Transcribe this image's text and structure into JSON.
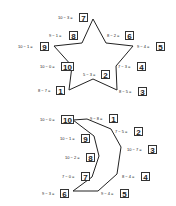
{
  "star": {
    "points": [
      {
        "n": "1",
        "eq": "8 − 7 =",
        "x": 69,
        "y": 90
      },
      {
        "n": "2",
        "eq": "5 − 3 =",
        "x": 93,
        "y": 79
      },
      {
        "n": "3",
        "eq": "8 − 5 =",
        "x": 117,
        "y": 90
      },
      {
        "n": "4",
        "eq": "7 − 3 =",
        "x": 116,
        "y": 66
      },
      {
        "n": "5",
        "eq": "9 − 4 =",
        "x": 133,
        "y": 46
      },
      {
        "n": "6",
        "eq": "8 − 2 =",
        "x": 106,
        "y": 43
      },
      {
        "n": "7",
        "eq": "10 − 3 =",
        "x": 93,
        "y": 19
      },
      {
        "n": "8",
        "eq": "9 − 1 =",
        "x": 82,
        "y": 43
      },
      {
        "n": "9",
        "eq": "10 − 1 =",
        "x": 54,
        "y": 46
      },
      {
        "n": "10",
        "eq": "10 − 0 =",
        "x": 72,
        "y": 66
      }
    ]
  },
  "moon": {
    "points": [
      {
        "n": "1",
        "eq": "9 − 8 =",
        "x": 87,
        "y": 119
      },
      {
        "n": "2",
        "eq": "7 − 5 =",
        "x": 111,
        "y": 129
      },
      {
        "n": "3",
        "eq": "10 − 7 =",
        "x": 121,
        "y": 147
      },
      {
        "n": "4",
        "eq": "8 − 4 =",
        "x": 117,
        "y": 174
      },
      {
        "n": "5",
        "eq": "9 − 4 =",
        "x": 98,
        "y": 191
      },
      {
        "n": "6",
        "eq": "9 − 3 =",
        "x": 73,
        "y": 191
      },
      {
        "n": "7",
        "eq": "7 − 0 =",
        "x": 92,
        "y": 177
      },
      {
        "n": "8",
        "eq": "10 − 2 =",
        "x": 99,
        "y": 156
      },
      {
        "n": "9",
        "eq": "10 − 1 =",
        "x": 94,
        "y": 136
      },
      {
        "n": "10",
        "eq": "10 − 0 =",
        "x": 73,
        "y": 120
      }
    ]
  },
  "labels": {
    "star": [
      {
        "eq": "10 − 3 =",
        "n": "7",
        "ex": 58,
        "ey": 15,
        "bx": 79,
        "by": 13
      },
      {
        "eq": "9 − 1 =",
        "n": "8",
        "ex": 49,
        "ey": 33,
        "bx": 69,
        "by": 31
      },
      {
        "eq": "10 − 1 =",
        "n": "9",
        "ex": 18,
        "ey": 44,
        "bx": 40,
        "by": 42
      },
      {
        "eq": "10 − 0 =",
        "n": "10",
        "ex": 40,
        "ey": 64,
        "bx": 61,
        "by": 62
      },
      {
        "eq": "8 − 7 =",
        "n": "1",
        "ex": 38,
        "ey": 88,
        "bx": 56,
        "by": 86
      },
      {
        "eq": "5 − 3 =",
        "n": "2",
        "ex": 83,
        "ey": 72,
        "bx": 101,
        "by": 70
      },
      {
        "eq": "8 − 2 =",
        "n": "6",
        "ex": 107,
        "ey": 33,
        "bx": 125,
        "by": 31
      },
      {
        "eq": "9 − 4 =",
        "n": "5",
        "ex": 137,
        "ey": 44,
        "bx": 156,
        "by": 42
      },
      {
        "eq": "7 − 3 =",
        "n": "4",
        "ex": 118,
        "ey": 64,
        "bx": 137,
        "by": 62
      },
      {
        "eq": "8 − 5 =",
        "n": "3",
        "ex": 119,
        "ey": 89,
        "bx": 138,
        "by": 87
      }
    ],
    "moon": [
      {
        "eq": "10 − 0 =",
        "n": "10",
        "ex": 40,
        "ey": 117,
        "bx": 61,
        "by": 115
      },
      {
        "eq": "9 − 8 =",
        "n": "1",
        "ex": 90,
        "ey": 116,
        "bx": 109,
        "by": 114
      },
      {
        "eq": "10 − 1 =",
        "n": "9",
        "ex": 60,
        "ey": 136,
        "bx": 81,
        "by": 134
      },
      {
        "eq": "7 − 5 =",
        "n": "2",
        "ex": 115,
        "ey": 129,
        "bx": 134,
        "by": 127
      },
      {
        "eq": "10 − 2 =",
        "n": "8",
        "ex": 65,
        "ey": 155,
        "bx": 86,
        "by": 153
      },
      {
        "eq": "10 − 7 =",
        "n": "3",
        "ex": 127,
        "ey": 147,
        "bx": 148,
        "by": 145
      },
      {
        "eq": "7 − 0 =",
        "n": "7",
        "ex": 62,
        "ey": 174,
        "bx": 81,
        "by": 172
      },
      {
        "eq": "8 − 4 =",
        "n": "4",
        "ex": 122,
        "ey": 174,
        "bx": 141,
        "by": 172
      },
      {
        "eq": "9 − 3 =",
        "n": "6",
        "ex": 42,
        "ey": 191,
        "bx": 60,
        "by": 189
      },
      {
        "eq": "9 − 4 =",
        "n": "5",
        "ex": 101,
        "ey": 191,
        "bx": 120,
        "by": 189
      }
    ]
  }
}
